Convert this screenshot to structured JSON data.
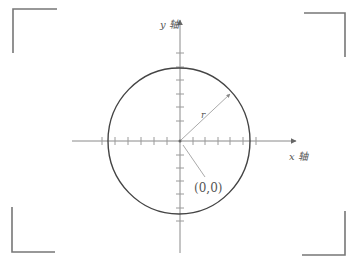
{
  "diagram": {
    "type": "circle-on-coordinate-axes",
    "x_axis_label": "x 轴",
    "y_axis_label": "y 轴",
    "radius_label": "r",
    "origin_label": "(0,0)",
    "colors": {
      "axis": "#8a8a8a",
      "circle": "#444444",
      "frame": "#777777",
      "text": "#555555"
    },
    "x_ticks_per_side": 6,
    "y_ticks_per_side": 6
  },
  "frame": {
    "corners": [
      "top-left",
      "top-right",
      "bottom-left",
      "bottom-right"
    ]
  }
}
